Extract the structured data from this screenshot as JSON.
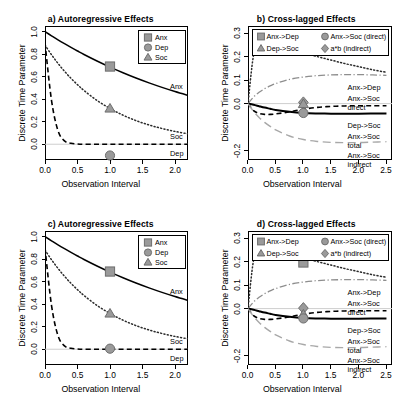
{
  "figure": {
    "axis_titles": {
      "x": "Observation Interval",
      "y": "Discrete Time Parameter"
    }
  },
  "panels": {
    "a": {
      "title": "a) Autoregressive Effects"
    },
    "b": {
      "title": "b) Cross-lagged Effects"
    },
    "c": {
      "title": "c) Autoregressive Effects"
    },
    "d": {
      "title": "d) Cross-lagged Effects"
    }
  },
  "legends": {
    "ar": [
      {
        "label": "Anx",
        "symbol": "square"
      },
      {
        "label": "Dep",
        "symbol": "circle"
      },
      {
        "label": "Soc",
        "symbol": "triangle"
      }
    ],
    "cl": [
      {
        "label": "Anx->Dep",
        "symbol": "square"
      },
      {
        "label": "Anx->Soc (direct)",
        "symbol": "circle"
      },
      {
        "label": "Dep->Soc",
        "symbol": "triangle"
      },
      {
        "label": "a*b (indirect)",
        "symbol": "diamond"
      }
    ]
  },
  "curve_labels": {
    "ar": [
      {
        "text": "Anx"
      },
      {
        "text": "Soc"
      },
      {
        "text": "Dep"
      }
    ],
    "cl": [
      {
        "text": "Anx->Dep"
      },
      {
        "text": "Anx->Soc"
      },
      {
        "text": "direct"
      },
      {
        "text": "Dep->Soc"
      },
      {
        "text": "Anx->Soc"
      },
      {
        "text": "total"
      },
      {
        "text": "Anx->Soc"
      },
      {
        "text": "indirect"
      }
    ]
  },
  "ticks": {
    "ar_x": [
      "0.0",
      "0.5",
      "1.0",
      "1.5",
      "2.0"
    ],
    "ar_y": [
      "0.0",
      "0.2",
      "0.4",
      "0.6",
      "0.8",
      "1.0"
    ],
    "cl_x": [
      "0.0",
      "0.5",
      "1.0",
      "1.5",
      "2.0",
      "2.5"
    ],
    "cl_y": [
      "-0.2",
      "0.0",
      "0.1",
      "0.2",
      "0.3"
    ]
  },
  "colors": {
    "marker_fill": "#9a9a9a",
    "marker_stroke": "#6e6e6e",
    "line_dark": "#000000",
    "line_gray": "#a8a8a8",
    "zero_line": "#cfcfcf"
  },
  "chart_data": [
    {
      "type": "line",
      "title": "a) Autoregressive Effects",
      "xlabel": "Observation Interval",
      "ylabel": "Discrete Time Parameter",
      "xlim": [
        0.0,
        2.2
      ],
      "ylim": [
        -0.14,
        1.05
      ],
      "grid": false,
      "legend": "top-right",
      "x": [
        0.0,
        0.1,
        0.2,
        0.3,
        0.4,
        0.5,
        0.6,
        0.8,
        1.0,
        1.2,
        1.4,
        1.6,
        1.8,
        2.0,
        2.2
      ],
      "series": [
        {
          "name": "Anx",
          "style": "solid",
          "values": [
            1.0,
            0.963,
            0.927,
            0.893,
            0.86,
            0.828,
            0.797,
            0.739,
            0.685,
            0.635,
            0.588,
            0.545,
            0.505,
            0.468,
            0.434
          ]
        },
        {
          "name": "Soc",
          "style": "dotted",
          "values": [
            0.88,
            0.795,
            0.718,
            0.648,
            0.585,
            0.529,
            0.477,
            0.389,
            0.317,
            0.258,
            0.21,
            0.171,
            0.14,
            0.114,
            0.092
          ]
        },
        {
          "name": "Dep",
          "style": "dashed",
          "values": [
            0.9,
            0.39,
            0.12,
            0.03,
            0.008,
            0.002,
            0.0,
            0.0,
            0.0,
            0.0,
            0.0,
            0.0,
            0.0,
            0.0,
            0.0
          ]
        }
      ],
      "markers": [
        {
          "name": "Anx",
          "symbol": "square",
          "x": 1.0,
          "y": 0.69
        },
        {
          "name": "Soc",
          "symbol": "triangle",
          "x": 1.0,
          "y": 0.315
        },
        {
          "name": "Dep",
          "symbol": "circle",
          "x": 1.0,
          "y": -0.1
        }
      ]
    },
    {
      "type": "line",
      "title": "b) Cross-lagged Effects",
      "xlabel": "Observation Interval",
      "ylabel": "Discrete Time Parameter",
      "xlim": [
        0.0,
        2.6
      ],
      "ylim": [
        -0.24,
        0.33
      ],
      "grid": false,
      "legend": "top",
      "x": [
        0.0,
        0.1,
        0.2,
        0.3,
        0.4,
        0.5,
        0.75,
        1.0,
        1.25,
        1.5,
        1.75,
        2.0,
        2.25,
        2.5
      ],
      "series": [
        {
          "name": "Anx->Dep",
          "style": "dotted",
          "values": [
            0.0,
            0.205,
            0.24,
            0.245,
            0.243,
            0.238,
            0.228,
            0.215,
            0.2,
            0.185,
            0.17,
            0.157,
            0.144,
            0.133
          ]
        },
        {
          "name": "Anx->Soc direct",
          "style": "dashdot",
          "values": [
            0.0,
            0.028,
            0.048,
            0.063,
            0.075,
            0.085,
            0.103,
            0.113,
            0.119,
            0.122,
            0.123,
            0.123,
            0.122,
            0.12
          ]
        },
        {
          "name": "Dep->Soc",
          "style": "dashed",
          "values": [
            0.0,
            -0.03,
            -0.042,
            -0.046,
            -0.046,
            -0.044,
            -0.035,
            -0.024,
            -0.016,
            -0.012,
            -0.01,
            -0.009,
            -0.009,
            -0.009
          ]
        },
        {
          "name": "Anx->Soc total",
          "style": "solid-bold",
          "values": [
            0.0,
            -0.005,
            -0.011,
            -0.017,
            -0.022,
            -0.027,
            -0.035,
            -0.04,
            -0.042,
            -0.043,
            -0.043,
            -0.043,
            -0.042,
            -0.042
          ]
        },
        {
          "name": "Anx->Soc indirect",
          "style": "longdash-gray",
          "values": [
            0.0,
            -0.033,
            -0.059,
            -0.08,
            -0.097,
            -0.112,
            -0.138,
            -0.153,
            -0.161,
            -0.165,
            -0.166,
            -0.166,
            -0.164,
            -0.162
          ]
        }
      ],
      "markers": [
        {
          "name": "Anx->Dep",
          "symbol": "square",
          "x": 1.0,
          "y": 0.228
        },
        {
          "name": "a*b (indirect)",
          "symbol": "diamond",
          "x": 1.0,
          "y": 0.005
        },
        {
          "name": "Dep->Soc",
          "symbol": "triangle",
          "x": 1.0,
          "y": -0.003
        },
        {
          "name": "Anx->Soc (direct)",
          "symbol": "circle",
          "x": 1.0,
          "y": -0.04
        }
      ]
    },
    {
      "type": "line",
      "title": "c) Autoregressive Effects",
      "xlabel": "Observation Interval",
      "ylabel": "Discrete Time Parameter",
      "xlim": [
        0.0,
        2.2
      ],
      "ylim": [
        -0.14,
        1.05
      ],
      "grid": false,
      "legend": "top-right",
      "x": [
        0.0,
        0.1,
        0.2,
        0.3,
        0.4,
        0.5,
        0.6,
        0.8,
        1.0,
        1.2,
        1.4,
        1.6,
        1.8,
        2.0,
        2.2
      ],
      "series": [
        {
          "name": "Anx",
          "style": "solid",
          "values": [
            1.0,
            0.963,
            0.927,
            0.893,
            0.86,
            0.828,
            0.797,
            0.739,
            0.685,
            0.635,
            0.588,
            0.545,
            0.505,
            0.468,
            0.434
          ]
        },
        {
          "name": "Soc",
          "style": "dotted",
          "values": [
            0.88,
            0.795,
            0.718,
            0.648,
            0.585,
            0.529,
            0.477,
            0.389,
            0.317,
            0.258,
            0.21,
            0.171,
            0.14,
            0.114,
            0.092
          ]
        },
        {
          "name": "Dep",
          "style": "dashed",
          "values": [
            0.9,
            0.39,
            0.12,
            0.03,
            0.008,
            0.002,
            0.0,
            0.0,
            0.0,
            0.0,
            0.0,
            0.0,
            0.0,
            0.0,
            0.0
          ]
        }
      ],
      "markers": [
        {
          "name": "Anx",
          "symbol": "square",
          "x": 1.0,
          "y": 0.69
        },
        {
          "name": "Soc",
          "symbol": "triangle",
          "x": 1.0,
          "y": 0.315
        },
        {
          "name": "Dep",
          "symbol": "circle",
          "x": 1.0,
          "y": 0.005
        }
      ]
    },
    {
      "type": "line",
      "title": "d) Cross-lagged Effects",
      "xlabel": "Observation Interval",
      "ylabel": "Discrete Time Parameter",
      "xlim": [
        0.0,
        2.6
      ],
      "ylim": [
        -0.24,
        0.33
      ],
      "grid": false,
      "legend": "top",
      "x": [
        0.0,
        0.1,
        0.2,
        0.3,
        0.4,
        0.5,
        0.75,
        1.0,
        1.25,
        1.5,
        1.75,
        2.0,
        2.25,
        2.5
      ],
      "series": [
        {
          "name": "Anx->Dep",
          "style": "dotted",
          "values": [
            0.0,
            0.205,
            0.24,
            0.245,
            0.243,
            0.238,
            0.228,
            0.215,
            0.2,
            0.185,
            0.17,
            0.157,
            0.144,
            0.133
          ]
        },
        {
          "name": "Anx->Soc direct",
          "style": "dashdot",
          "values": [
            0.0,
            0.028,
            0.048,
            0.063,
            0.075,
            0.085,
            0.103,
            0.113,
            0.119,
            0.122,
            0.123,
            0.123,
            0.122,
            0.12
          ]
        },
        {
          "name": "Dep->Soc",
          "style": "dashed",
          "values": [
            0.0,
            -0.03,
            -0.042,
            -0.046,
            -0.046,
            -0.044,
            -0.035,
            -0.024,
            -0.016,
            -0.012,
            -0.01,
            -0.009,
            -0.009,
            -0.009
          ]
        },
        {
          "name": "Anx->Soc total",
          "style": "solid-bold",
          "values": [
            0.0,
            -0.005,
            -0.011,
            -0.017,
            -0.022,
            -0.027,
            -0.035,
            -0.04,
            -0.042,
            -0.043,
            -0.043,
            -0.043,
            -0.042,
            -0.042
          ]
        },
        {
          "name": "Anx->Soc indirect",
          "style": "longdash-gray",
          "values": [
            0.0,
            -0.033,
            -0.059,
            -0.08,
            -0.097,
            -0.112,
            -0.138,
            -0.153,
            -0.161,
            -0.165,
            -0.166,
            -0.166,
            -0.164,
            -0.162
          ]
        }
      ],
      "markers": [
        {
          "name": "a*b (indirect)",
          "symbol": "diamond",
          "x": 1.0,
          "y": 0.002
        },
        {
          "name": "Dep->Soc",
          "symbol": "triangle",
          "x": 1.0,
          "y": -0.026
        },
        {
          "name": "Anx->Soc (direct)",
          "symbol": "circle",
          "x": 1.0,
          "y": -0.042
        },
        {
          "name": "Anx->Dep",
          "symbol": "square",
          "x": 1.0,
          "y": 0.196
        }
      ]
    }
  ]
}
